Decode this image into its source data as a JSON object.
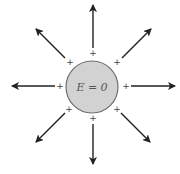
{
  "diagram": {
    "conductor": {
      "label": "E = 0",
      "center": [
        92,
        87
      ],
      "radius": 26,
      "fill": "#d2d2d2",
      "stroke": "#6e6e6e"
    },
    "charge_symbol": "+",
    "charges": [
      {
        "id": "top",
        "x": 93,
        "y": 56
      },
      {
        "id": "top-right",
        "x": 117,
        "y": 65
      },
      {
        "id": "right",
        "x": 126,
        "y": 89
      },
      {
        "id": "bottom-right",
        "x": 117,
        "y": 112
      },
      {
        "id": "bottom",
        "x": 93,
        "y": 121
      },
      {
        "id": "bottom-left",
        "x": 69,
        "y": 112
      },
      {
        "id": "left",
        "x": 60,
        "y": 89
      },
      {
        "id": "top-left",
        "x": 70,
        "y": 65
      }
    ],
    "field_lines": [
      {
        "id": "up",
        "from": [
          93,
          48
        ],
        "to": [
          93,
          5
        ]
      },
      {
        "id": "up-right",
        "from": [
          122,
          58
        ],
        "to": [
          151,
          29
        ]
      },
      {
        "id": "right",
        "from": [
          131,
          86
        ],
        "to": [
          175,
          86
        ]
      },
      {
        "id": "down-right",
        "from": [
          121,
          113
        ],
        "to": [
          150,
          142
        ]
      },
      {
        "id": "down",
        "from": [
          93,
          124
        ],
        "to": [
          93,
          164
        ]
      },
      {
        "id": "down-left",
        "from": [
          65,
          113
        ],
        "to": [
          36,
          142
        ]
      },
      {
        "id": "left",
        "from": [
          55,
          86
        ],
        "to": [
          12,
          86
        ]
      },
      {
        "id": "up-left",
        "from": [
          65,
          58
        ],
        "to": [
          36,
          29
        ]
      }
    ],
    "arrow_color": "#222222"
  }
}
